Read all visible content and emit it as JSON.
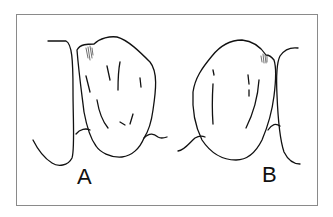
{
  "figure": {
    "panels": [
      {
        "label": "A"
      },
      {
        "label": "B"
      }
    ],
    "colors": {
      "line": "#111111",
      "frame": "#8a8a8a",
      "background": "#ffffff"
    }
  }
}
